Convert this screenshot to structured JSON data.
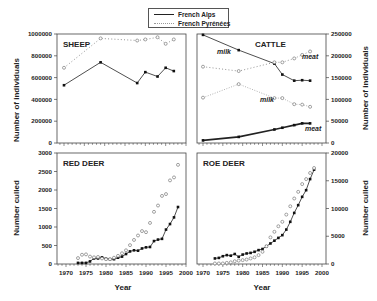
{
  "legend": {
    "items": [
      {
        "label": "French Alps",
        "style": "solid",
        "color": "#222222"
      },
      {
        "label": "French Pyrénées",
        "style": "dotted",
        "color": "#999999"
      }
    ]
  },
  "axis_titles": {
    "left_top": "Number of individuals",
    "left_bottom": "Number culled",
    "right_top": "Number of individuals",
    "right_bottom": "Number culled",
    "x_left": "Year",
    "x_right": "Year"
  },
  "chart_data": [
    {
      "type": "line",
      "title": "SHEEP",
      "xlabel": "",
      "ylabel": "Number of individuals",
      "xlim": [
        1968,
        1999
      ],
      "ylim": [
        0,
        1000000
      ],
      "yticks": [
        0,
        200000,
        400000,
        600000,
        800000,
        1000000
      ],
      "ytick_labels": [
        "0",
        "200000",
        "400000",
        "600000",
        "800000",
        "1000000"
      ],
      "series": [
        {
          "name": "French Alps",
          "x": [
            1970,
            1979,
            1988,
            1990,
            1993,
            1995,
            1997
          ],
          "values": [
            530000,
            740000,
            550000,
            650000,
            610000,
            690000,
            660000
          ]
        },
        {
          "name": "French Pyrénées",
          "x": [
            1970,
            1979,
            1988,
            1990,
            1993,
            1995,
            1997
          ],
          "values": [
            690000,
            960000,
            940000,
            950000,
            970000,
            910000,
            950000
          ]
        }
      ]
    },
    {
      "type": "line",
      "title": "CATTLE",
      "xlabel": "",
      "ylabel": "Number of individuals",
      "xlim": [
        1968,
        1999
      ],
      "ylim": [
        0,
        250000
      ],
      "yticks": [
        0,
        50000,
        100000,
        150000,
        200000,
        250000
      ],
      "ytick_labels": [
        "0",
        "50000",
        "100000",
        "150000",
        "200000",
        "250000"
      ],
      "annotations": [
        "milk",
        "meat",
        "milk",
        "meat"
      ],
      "series": [
        {
          "name": "French Alps milk",
          "x": [
            1970,
            1979,
            1988,
            1990,
            1993,
            1995,
            1997
          ],
          "values": [
            248000,
            213000,
            182000,
            157000,
            143000,
            144000,
            143000
          ]
        },
        {
          "name": "French Pyrénées meat",
          "x": [
            1970,
            1979,
            1988,
            1990,
            1993,
            1995,
            1997
          ],
          "values": [
            175000,
            165000,
            185000,
            185000,
            194000,
            202000,
            210000
          ]
        },
        {
          "name": "French Pyrénées milk",
          "x": [
            1970,
            1979,
            1988,
            1990,
            1993,
            1995,
            1997
          ],
          "values": [
            104000,
            135000,
            103000,
            103000,
            89000,
            88000,
            83000
          ]
        },
        {
          "name": "French Alps meat",
          "x": [
            1970,
            1979,
            1988,
            1990,
            1993,
            1995,
            1997
          ],
          "values": [
            6000,
            14000,
            31000,
            35000,
            41000,
            45000,
            45000
          ]
        }
      ]
    },
    {
      "type": "line",
      "title": "RED DEER",
      "xlabel": "Year",
      "ylabel": "Number culled",
      "xlim": [
        1968,
        2000
      ],
      "ylim": [
        0,
        3000
      ],
      "xticks": [
        1970,
        1975,
        1980,
        1985,
        1990,
        1995,
        2000
      ],
      "yticks": [
        0,
        500,
        1000,
        1500,
        2000,
        2500,
        3000
      ],
      "series": [
        {
          "name": "French Alps",
          "x": [
            1973,
            1974,
            1975,
            1976,
            1977,
            1978,
            1979,
            1980,
            1981,
            1982,
            1983,
            1984,
            1985,
            1986,
            1987,
            1988,
            1989,
            1990,
            1991,
            1992,
            1993,
            1994,
            1995,
            1996,
            1997,
            1998
          ],
          "values": [
            30,
            30,
            30,
            70,
            150,
            150,
            180,
            140,
            130,
            130,
            170,
            200,
            270,
            340,
            370,
            360,
            420,
            450,
            460,
            620,
            660,
            680,
            930,
            1080,
            1260,
            1540
          ]
        },
        {
          "name": "French Pyrénées",
          "x": [
            1973,
            1974,
            1975,
            1976,
            1977,
            1978,
            1979,
            1980,
            1981,
            1982,
            1983,
            1984,
            1985,
            1986,
            1987,
            1988,
            1989,
            1990,
            1991,
            1992,
            1993,
            1994,
            1995,
            1996,
            1997,
            1998
          ],
          "values": [
            160,
            250,
            260,
            200,
            180,
            190,
            150,
            130,
            130,
            170,
            220,
            290,
            370,
            510,
            650,
            770,
            890,
            860,
            1110,
            1410,
            1580,
            1840,
            1890,
            2260,
            2340,
            2680
          ]
        }
      ]
    },
    {
      "type": "line",
      "title": "ROE DEER",
      "xlabel": "Year",
      "ylabel": "Number culled",
      "xlim": [
        1968,
        2000
      ],
      "ylim": [
        0,
        20000
      ],
      "xticks": [
        1970,
        1975,
        1980,
        1985,
        1990,
        1995,
        2000
      ],
      "yticks": [
        0,
        5000,
        10000,
        15000,
        20000
      ],
      "series": [
        {
          "name": "French Alps",
          "x": [
            1973,
            1974,
            1975,
            1976,
            1977,
            1978,
            1979,
            1980,
            1981,
            1982,
            1983,
            1984,
            1985,
            1986,
            1987,
            1988,
            1989,
            1990,
            1991,
            1992,
            1993,
            1994,
            1995,
            1996,
            1997,
            1998
          ],
          "values": [
            1000,
            1100,
            1400,
            1600,
            1500,
            1800,
            1300,
            1700,
            1900,
            2000,
            2200,
            2500,
            2700,
            3200,
            3700,
            4200,
            4700,
            5200,
            6200,
            7600,
            9200,
            10600,
            12100,
            13300,
            15300,
            17000
          ]
        },
        {
          "name": "French Pyrénées",
          "x": [
            1973,
            1974,
            1975,
            1976,
            1977,
            1978,
            1979,
            1980,
            1981,
            1982,
            1983,
            1984,
            1985,
            1986,
            1987,
            1988,
            1989,
            1990,
            1991,
            1992,
            1993,
            1994,
            1995,
            1996,
            1997,
            1998
          ],
          "values": [
            100,
            100,
            100,
            200,
            300,
            500,
            600,
            700,
            800,
            1000,
            1200,
            1600,
            2200,
            3200,
            4800,
            5800,
            6800,
            7600,
            8900,
            10400,
            11800,
            13000,
            14400,
            15300,
            16400,
            17300
          ]
        }
      ]
    }
  ]
}
